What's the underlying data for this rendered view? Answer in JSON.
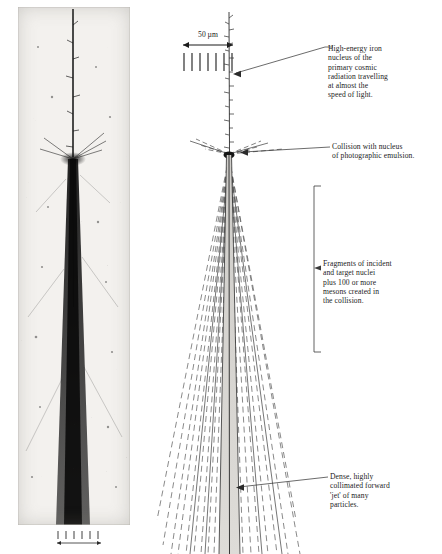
{
  "figure": {
    "type": "annotated-scientific-photograph"
  },
  "photo": {
    "alt_name": "nuclear-emulsion-photomicrograph",
    "scale_bar_label": ""
  },
  "scale_legend": {
    "value": "50",
    "unit": "µm",
    "label": "50 µm",
    "tick_count": 6
  },
  "annotations": [
    {
      "id": "iron-nucleus",
      "lines": [
        "High-energy iron",
        "nucleus of the",
        "primary cosmic",
        "radiation travelling",
        "at almost the",
        "speed of light."
      ]
    },
    {
      "id": "collision",
      "lines": [
        "Collision with nucleus",
        "of photographic emulsion."
      ]
    },
    {
      "id": "fragments",
      "lines": [
        "Fragments of incident",
        "and target nuclei",
        "plus 100 or more",
        "mesons created in",
        "the collision."
      ]
    },
    {
      "id": "jet",
      "lines": [
        "Dense, highly",
        "collimated forward",
        "'jet' of many",
        "particles."
      ]
    }
  ],
  "colors": {
    "ink": "#1b1b1b",
    "rule": "#444444",
    "dashed_track": "#6f6f6f",
    "jet_fill": "#d8d6d2",
    "photo_base": "#f1efec"
  }
}
